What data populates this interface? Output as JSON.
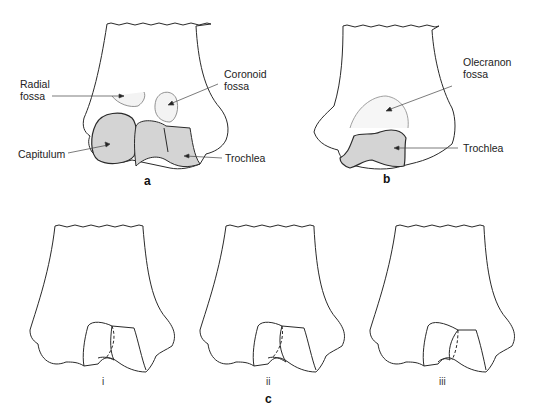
{
  "figure": {
    "panel_a": {
      "letter": "a",
      "labels": {
        "radial_fossa": "Radial\nfossa",
        "coronoid_fossa": "Coronoid\nfossa",
        "capitulum": "Capitulum",
        "trochlea": "Trochlea"
      }
    },
    "panel_b": {
      "letter": "b",
      "labels": {
        "olecranon_fossa": "Olecranon\nfossa",
        "trochlea": "Trochlea"
      }
    },
    "panel_c": {
      "letter": "c",
      "subpanels": [
        "i",
        "ii",
        "iii"
      ]
    },
    "colors": {
      "outline": "#2a2a2a",
      "shaded_articular": "#d4d4d4",
      "fossa_shade": "#ececec",
      "leader_line": "#444444"
    }
  }
}
